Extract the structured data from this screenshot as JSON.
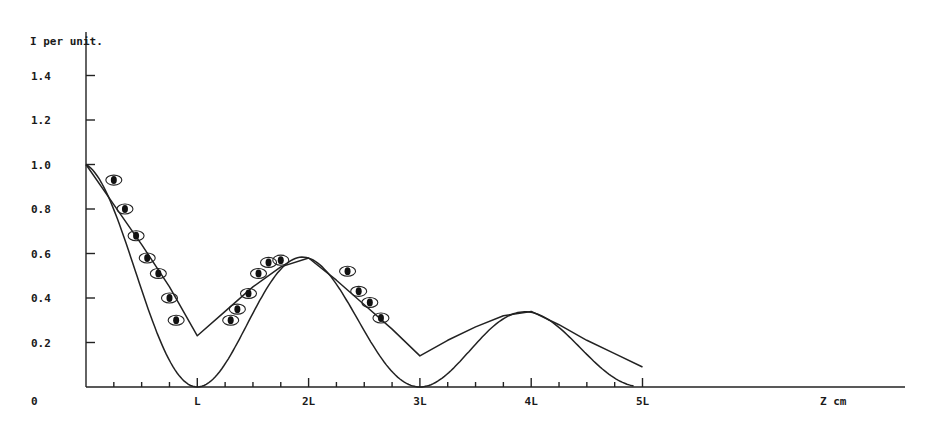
{
  "chart_data": {
    "type": "line",
    "title": "",
    "ylabel": "I per unit.",
    "xlabel": "Z cm",
    "ylim": [
      0,
      1.5
    ],
    "xlim_units_of_L": [
      0,
      7.3
    ],
    "grid": false,
    "legend": null,
    "y_ticks": [
      {
        "value": 0.0,
        "label": "0"
      },
      {
        "value": 0.2,
        "label": "0.2"
      },
      {
        "value": 0.4,
        "label": "0.4"
      },
      {
        "value": 0.6,
        "label": "0.6"
      },
      {
        "value": 0.8,
        "label": "0.8"
      },
      {
        "value": 1.0,
        "label": "1.0"
      },
      {
        "value": 1.2,
        "label": "1.2"
      },
      {
        "value": 1.4,
        "label": "1.4"
      }
    ],
    "x_ticks": [
      {
        "value": 1,
        "label": "L"
      },
      {
        "value": 2,
        "label": "2L"
      },
      {
        "value": 3,
        "label": "3L"
      },
      {
        "value": 4,
        "label": "4L"
      },
      {
        "value": 5,
        "label": "5L"
      }
    ],
    "x_minor_tick_step": 0.25,
    "series": [
      {
        "name": "theoretical envelope (upper curve)",
        "style": "line",
        "x": [
          0,
          0.25,
          0.5,
          0.75,
          1.0,
          1.25,
          1.5,
          1.75,
          2.0,
          2.25,
          2.5,
          2.75,
          3.0,
          3.25,
          3.5,
          3.75,
          4.0,
          4.25,
          4.5,
          4.75,
          5.0
        ],
        "y": [
          1.0,
          0.82,
          0.64,
          0.45,
          0.23,
          0.34,
          0.45,
          0.54,
          0.58,
          0.48,
          0.37,
          0.26,
          0.14,
          0.21,
          0.27,
          0.32,
          0.34,
          0.28,
          0.21,
          0.15,
          0.09
        ]
      },
      {
        "name": "theoretical |cos| curve (lower curve)",
        "style": "line",
        "x": [
          0,
          0.25,
          0.5,
          0.75,
          1.0,
          1.25,
          1.5,
          1.75,
          2.0,
          2.25,
          2.5,
          2.75,
          3.0,
          3.25,
          3.5,
          3.75,
          4.0,
          4.25,
          4.5,
          4.75,
          5.0
        ],
        "y": [
          1.0,
          0.75,
          0.42,
          0.14,
          0.0,
          0.1,
          0.3,
          0.5,
          0.58,
          0.5,
          0.29,
          0.08,
          0.0,
          0.05,
          0.17,
          0.29,
          0.34,
          0.29,
          0.17,
          0.05,
          0.0
        ]
      },
      {
        "name": "measured points",
        "style": "scatter",
        "marker": "circled-dot",
        "x": [
          0.25,
          0.35,
          0.45,
          0.55,
          0.65,
          0.75,
          0.81,
          1.3,
          1.36,
          1.46,
          1.55,
          1.64,
          1.75,
          2.35,
          2.45,
          2.55,
          2.65
        ],
        "y": [
          0.93,
          0.8,
          0.68,
          0.58,
          0.51,
          0.4,
          0.3,
          0.3,
          0.35,
          0.42,
          0.51,
          0.56,
          0.57,
          0.52,
          0.43,
          0.38,
          0.31
        ]
      }
    ]
  },
  "labels": {
    "y_axis_title": "I per unit.",
    "x_axis_title": "Z cm",
    "origin": "0"
  },
  "colors": {
    "ink": "#222222",
    "background": "#ffffff"
  }
}
